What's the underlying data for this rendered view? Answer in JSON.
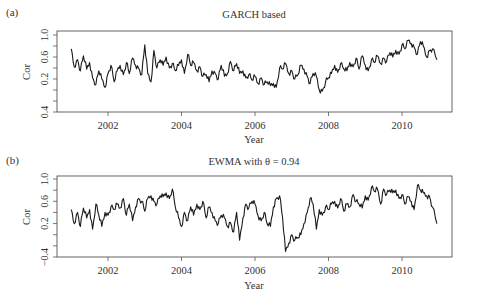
{
  "chart_data": [
    {
      "type": "line",
      "panel_label": "(a)",
      "title": "GARCH based",
      "xlabel": "Year",
      "ylabel": "Cor",
      "xlim": [
        2000.6,
        2011.35
      ],
      "ylim": [
        -0.4,
        1.0
      ],
      "xticks": [
        2002,
        2004,
        2006,
        2008,
        2010
      ],
      "yticks": [
        -0.4,
        -0.2,
        0.0,
        0.2,
        0.4,
        0.6,
        0.8,
        1.0
      ],
      "ytick_labels": [
        {
          "value": -0.4,
          "label": "0.4"
        },
        {
          "value": 0.2,
          "label": "0.2"
        },
        {
          "value": 0.6,
          "label": "0.6"
        },
        {
          "value": 1.0,
          "label": "1.0"
        }
      ],
      "grid": false,
      "legend": null,
      "series": [
        {
          "name": "GARCH correlation",
          "x": [
            2001.0,
            2001.08,
            2001.17,
            2001.25,
            2001.33,
            2001.42,
            2001.5,
            2001.58,
            2001.67,
            2001.75,
            2001.83,
            2001.92,
            2002.0,
            2002.08,
            2002.17,
            2002.25,
            2002.33,
            2002.42,
            2002.5,
            2002.58,
            2002.67,
            2002.75,
            2002.83,
            2002.92,
            2003.0,
            2003.08,
            2003.17,
            2003.25,
            2003.33,
            2003.42,
            2003.5,
            2003.58,
            2003.67,
            2003.75,
            2003.83,
            2003.92,
            2004.0,
            2004.08,
            2004.17,
            2004.25,
            2004.33,
            2004.42,
            2004.5,
            2004.58,
            2004.67,
            2004.75,
            2004.83,
            2004.92,
            2005.0,
            2005.08,
            2005.17,
            2005.25,
            2005.33,
            2005.42,
            2005.5,
            2005.58,
            2005.67,
            2005.75,
            2005.83,
            2005.92,
            2006.0,
            2006.08,
            2006.17,
            2006.25,
            2006.33,
            2006.42,
            2006.5,
            2006.58,
            2006.67,
            2006.75,
            2006.83,
            2006.92,
            2007.0,
            2007.08,
            2007.17,
            2007.25,
            2007.33,
            2007.42,
            2007.5,
            2007.58,
            2007.67,
            2007.75,
            2007.83,
            2007.92,
            2008.0,
            2008.08,
            2008.17,
            2008.25,
            2008.33,
            2008.42,
            2008.5,
            2008.58,
            2008.67,
            2008.75,
            2008.83,
            2008.92,
            2009.0,
            2009.08,
            2009.17,
            2009.25,
            2009.33,
            2009.42,
            2009.5,
            2009.58,
            2009.67,
            2009.75,
            2009.83,
            2009.92,
            2010.0,
            2010.08,
            2010.17,
            2010.25,
            2010.33,
            2010.42,
            2010.5,
            2010.58,
            2010.67,
            2010.75,
            2010.83,
            2010.95
          ],
          "values": [
            0.75,
            0.42,
            0.55,
            0.35,
            0.62,
            0.38,
            0.5,
            0.22,
            0.1,
            0.35,
            0.2,
            0.05,
            0.3,
            0.45,
            0.15,
            0.35,
            0.45,
            0.28,
            0.5,
            0.3,
            0.58,
            0.45,
            0.4,
            0.28,
            0.82,
            0.3,
            0.15,
            0.72,
            0.4,
            0.55,
            0.45,
            0.6,
            0.4,
            0.48,
            0.35,
            0.45,
            0.55,
            0.3,
            0.65,
            0.45,
            0.5,
            0.35,
            0.42,
            0.25,
            0.28,
            0.15,
            0.35,
            0.3,
            0.2,
            0.45,
            0.25,
            0.3,
            0.52,
            0.35,
            0.48,
            0.3,
            0.35,
            0.22,
            0.28,
            0.18,
            0.25,
            0.12,
            0.22,
            0.1,
            0.15,
            0.08,
            0.12,
            0.05,
            0.4,
            0.38,
            0.48,
            0.3,
            0.35,
            0.2,
            0.28,
            0.45,
            0.38,
            0.25,
            0.12,
            0.3,
            0.25,
            0.0,
            -0.02,
            0.15,
            0.22,
            0.3,
            0.45,
            0.32,
            0.48,
            0.38,
            0.35,
            0.5,
            0.42,
            0.58,
            0.38,
            0.62,
            0.45,
            0.35,
            0.55,
            0.5,
            0.62,
            0.48,
            0.58,
            0.52,
            0.68,
            0.6,
            0.72,
            0.65,
            0.82,
            0.75,
            0.9,
            0.85,
            0.78,
            0.65,
            0.88,
            0.8,
            0.6,
            0.72,
            0.75,
            0.55
          ]
        }
      ]
    },
    {
      "type": "line",
      "panel_label": "(b)",
      "title": "EWMA with θ = 0.94",
      "xlabel": "Year",
      "ylabel": "Cor",
      "xlim": [
        2000.6,
        2011.35
      ],
      "ylim": [
        -0.4,
        1.0
      ],
      "xticks": [
        2002,
        2004,
        2006,
        2008,
        2010
      ],
      "yticks": [
        -0.4,
        -0.2,
        0.0,
        0.2,
        0.4,
        0.6,
        0.8,
        1.0
      ],
      "ytick_labels": [
        {
          "value": -0.4,
          "label": "−0.4"
        },
        {
          "value": 0.2,
          "label": "0.2"
        },
        {
          "value": 0.6,
          "label": "0.6"
        },
        {
          "value": 1.0,
          "label": "1.0"
        }
      ],
      "grid": false,
      "legend": null,
      "series": [
        {
          "name": "EWMA correlation",
          "x": [
            2001.0,
            2001.08,
            2001.17,
            2001.25,
            2001.33,
            2001.42,
            2001.5,
            2001.58,
            2001.67,
            2001.75,
            2001.83,
            2001.92,
            2002.0,
            2002.08,
            2002.17,
            2002.25,
            2002.33,
            2002.42,
            2002.5,
            2002.58,
            2002.67,
            2002.75,
            2002.83,
            2002.92,
            2003.0,
            2003.08,
            2003.17,
            2003.25,
            2003.33,
            2003.42,
            2003.5,
            2003.58,
            2003.67,
            2003.75,
            2003.83,
            2003.92,
            2004.0,
            2004.08,
            2004.17,
            2004.25,
            2004.33,
            2004.42,
            2004.5,
            2004.58,
            2004.67,
            2004.75,
            2004.83,
            2004.92,
            2005.0,
            2005.08,
            2005.17,
            2005.25,
            2005.33,
            2005.42,
            2005.5,
            2005.58,
            2005.67,
            2005.75,
            2005.83,
            2005.92,
            2006.0,
            2006.08,
            2006.17,
            2006.25,
            2006.33,
            2006.42,
            2006.5,
            2006.58,
            2006.67,
            2006.75,
            2006.83,
            2006.92,
            2007.0,
            2007.08,
            2007.17,
            2007.25,
            2007.33,
            2007.42,
            2007.5,
            2007.58,
            2007.67,
            2007.75,
            2007.83,
            2007.92,
            2008.0,
            2008.08,
            2008.17,
            2008.25,
            2008.33,
            2008.42,
            2008.5,
            2008.58,
            2008.67,
            2008.75,
            2008.83,
            2008.92,
            2009.0,
            2009.08,
            2009.17,
            2009.25,
            2009.33,
            2009.42,
            2009.5,
            2009.58,
            2009.67,
            2009.75,
            2009.83,
            2009.92,
            2010.0,
            2010.08,
            2010.17,
            2010.25,
            2010.33,
            2010.42,
            2010.5,
            2010.58,
            2010.67,
            2010.75,
            2010.83,
            2010.95
          ],
          "values": [
            0.45,
            0.2,
            0.4,
            0.15,
            0.48,
            0.3,
            0.45,
            0.1,
            0.55,
            0.35,
            0.15,
            0.4,
            0.35,
            0.5,
            0.45,
            0.55,
            0.48,
            0.65,
            0.35,
            0.55,
            0.25,
            0.5,
            0.65,
            0.6,
            0.42,
            0.65,
            0.7,
            0.6,
            0.55,
            0.7,
            0.68,
            0.75,
            0.65,
            0.82,
            0.5,
            0.3,
            0.15,
            0.4,
            0.25,
            0.5,
            0.35,
            0.55,
            0.45,
            0.6,
            0.3,
            0.5,
            0.4,
            0.25,
            0.2,
            0.35,
            0.3,
            0.15,
            0.22,
            0.05,
            0.4,
            -0.1,
            0.3,
            0.55,
            0.48,
            0.6,
            0.55,
            0.35,
            0.25,
            0.4,
            0.2,
            0.15,
            0.5,
            0.65,
            0.7,
            0.3,
            -0.3,
            -0.15,
            0.0,
            -0.1,
            -0.05,
            0.0,
            0.2,
            0.4,
            0.65,
            0.55,
            0.1,
            0.45,
            0.35,
            0.5,
            0.45,
            0.55,
            0.6,
            0.48,
            0.65,
            0.42,
            0.55,
            0.5,
            0.72,
            0.6,
            0.55,
            0.48,
            0.7,
            0.62,
            0.85,
            0.78,
            0.82,
            0.55,
            0.82,
            0.72,
            0.8,
            0.75,
            0.8,
            0.65,
            0.72,
            0.55,
            0.68,
            0.6,
            0.45,
            0.88,
            0.8,
            0.75,
            0.7,
            0.68,
            0.5,
            0.2
          ]
        }
      ]
    }
  ]
}
